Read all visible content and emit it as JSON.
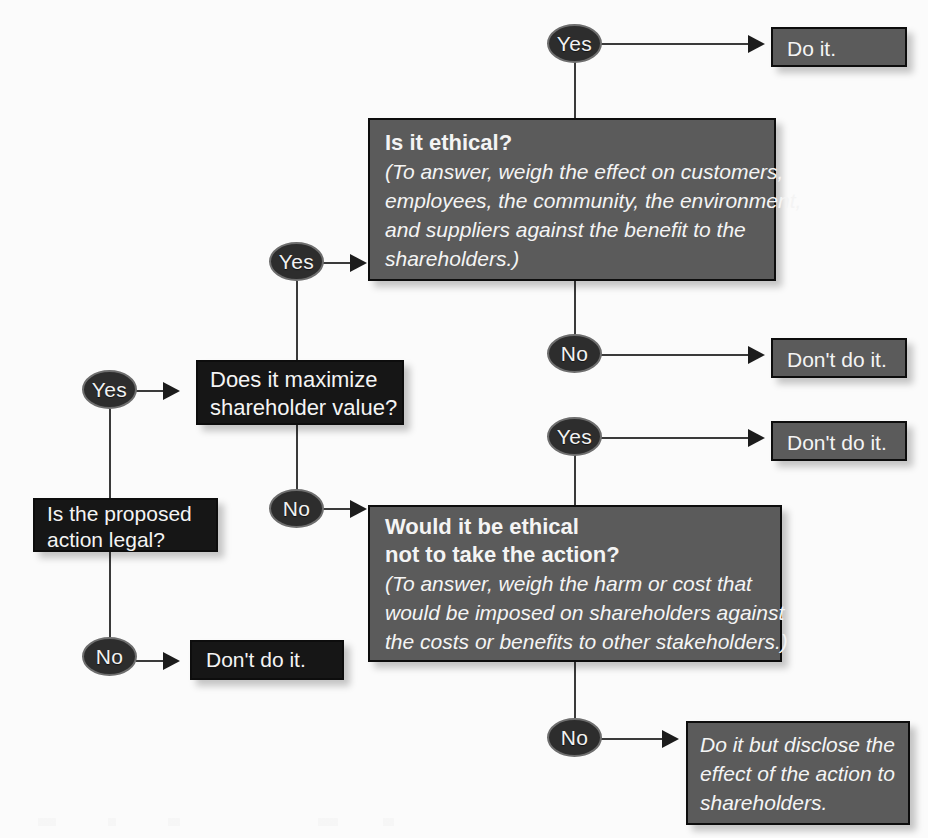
{
  "diagram": {
    "colors": {
      "black_box": "#161616",
      "gray_box": "#5b5b5b",
      "node_fill": "#2d2d2d",
      "node_border": "#6e6e6e",
      "connector": "#3a3a3a",
      "text": "#f4f4f4",
      "background": "#fbfbfb"
    }
  },
  "nodes": {
    "start": {
      "id": "is-the-proposed-action-legal",
      "lines": [
        "Is the proposed",
        "action legal?"
      ],
      "style": "black"
    },
    "maximize": {
      "id": "does-it-maximize-shareholder-value",
      "lines": [
        "Does it maximize",
        "shareholder value?"
      ],
      "style": "black"
    },
    "is_ethical": {
      "id": "is-it-ethical",
      "heading": "Is it ethical?",
      "note_lines": [
        "(To answer, weigh the effect on customers,",
        "employees, the community, the environment,",
        "and suppliers against the benefit to the",
        "shareholders.)"
      ],
      "style": "gray"
    },
    "would_be_ethical": {
      "id": "would-it-be-ethical-not-to-take-the-action",
      "heading_lines": [
        "Would it be ethical",
        "not to take the action?"
      ],
      "note_lines": [
        "(To answer, weigh the harm or cost that",
        "would be imposed on shareholders against",
        "the costs or benefits to other stakeholders.)"
      ],
      "style": "gray"
    }
  },
  "outcomes": {
    "do_it": {
      "id": "do-it",
      "text": "Do it.",
      "style": "gray"
    },
    "dont_do_it_ethical_no": {
      "id": "dont-do-it-ethical-no",
      "text": "Don't do it.",
      "style": "gray"
    },
    "dont_do_it_would_be_ethical_yes": {
      "id": "dont-do-it-would-be-ethical-yes",
      "text": "Don't do it.",
      "style": "gray"
    },
    "dont_do_it_illegal": {
      "id": "dont-do-it-illegal",
      "text": "Don't do it.",
      "style": "black"
    },
    "disclose": {
      "id": "do-it-but-disclose",
      "lines": [
        "Do it but disclose the",
        "effect of the action to",
        "shareholders."
      ],
      "style": "gray"
    }
  },
  "labels": {
    "yes_ethical_top": "Yes",
    "yes_maximize_branch": "Yes",
    "yes_legal": "Yes",
    "yes_would_be_ethical": "Yes",
    "no_ethical": "No",
    "no_maximize": "No",
    "no_legal": "No",
    "no_would_be_ethical": "No"
  },
  "edges": [
    {
      "from": "is-the-proposed-action-legal",
      "label": "Yes",
      "to": "does-it-maximize-shareholder-value"
    },
    {
      "from": "is-the-proposed-action-legal",
      "label": "No",
      "to": "dont-do-it-illegal"
    },
    {
      "from": "does-it-maximize-shareholder-value",
      "label": "Yes",
      "to": "is-it-ethical"
    },
    {
      "from": "does-it-maximize-shareholder-value",
      "label": "No",
      "to": "would-it-be-ethical-not-to-take-the-action"
    },
    {
      "from": "is-it-ethical",
      "label": "Yes",
      "to": "do-it"
    },
    {
      "from": "is-it-ethical",
      "label": "No",
      "to": "dont-do-it-ethical-no"
    },
    {
      "from": "would-it-be-ethical-not-to-take-the-action",
      "label": "Yes",
      "to": "dont-do-it-would-be-ethical-yes"
    },
    {
      "from": "would-it-be-ethical-not-to-take-the-action",
      "label": "No",
      "to": "do-it-but-disclose"
    }
  ]
}
